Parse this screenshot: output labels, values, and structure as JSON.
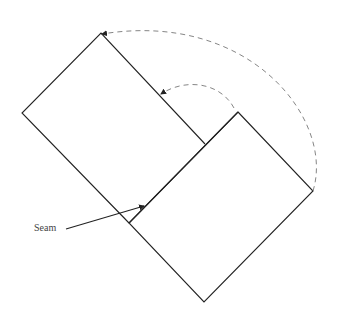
{
  "diagram": {
    "label": "Seam",
    "colors": {
      "stroke": "#222222",
      "dashed": "#777777",
      "background": "#ffffff"
    },
    "upper_rect": [
      [
        101,
        33
      ],
      [
        205,
        144
      ],
      [
        129,
        223
      ],
      [
        22,
        113
      ]
    ],
    "lower_rect": [
      [
        238,
        112
      ],
      [
        313,
        191
      ],
      [
        204,
        302
      ],
      [
        129,
        223
      ]
    ],
    "seam_extension": [
      [
        129,
        223
      ],
      [
        141,
        210
      ]
    ]
  }
}
